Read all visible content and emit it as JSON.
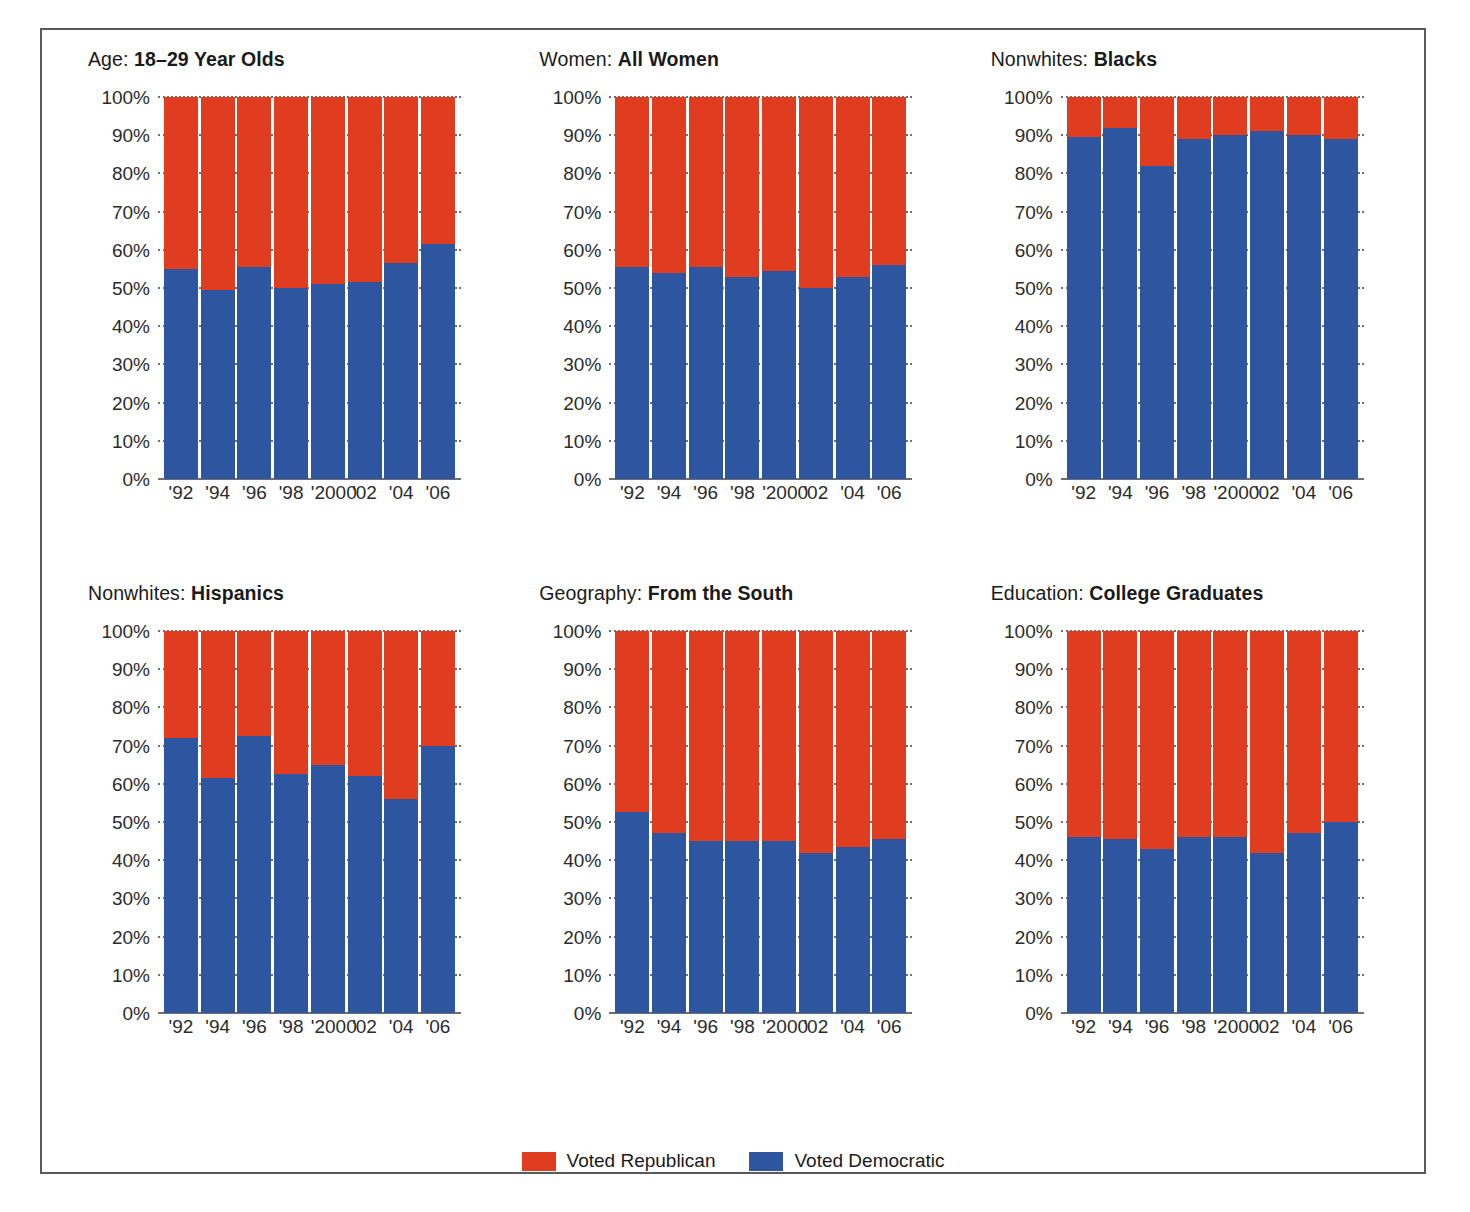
{
  "chart_data": {
    "type": "bar",
    "subtype": "stacked-100-percent",
    "title": "",
    "xlabel": "",
    "ylabel": "",
    "ylim": [
      0,
      100
    ],
    "ytick_labels": [
      "100%",
      "90%",
      "80%",
      "70%",
      "60%",
      "50%",
      "40%",
      "30%",
      "20%",
      "10%",
      "0%"
    ],
    "ytick_values": [
      100,
      90,
      80,
      70,
      60,
      50,
      40,
      30,
      20,
      10,
      0
    ],
    "grid": true,
    "legend_position": "bottom-center",
    "categories": [
      "'92",
      "'94",
      "'96",
      "'98",
      "'2000",
      "'02",
      "'04",
      "'06"
    ],
    "series": [
      {
        "name": "Voted Democratic",
        "color": "#2e56a0"
      },
      {
        "name": "Voted Republican",
        "color": "#e03c20"
      }
    ],
    "panels": [
      {
        "id": "age-18-29",
        "title_prefix": "Age:",
        "title_bold": "18–29 Year Olds",
        "democratic": [
          55,
          49.5,
          55.5,
          50,
          51,
          51.5,
          56.5,
          61.5
        ],
        "republican": [
          45,
          50.5,
          44.5,
          50,
          49,
          48.5,
          43.5,
          38.5
        ]
      },
      {
        "id": "women-all",
        "title_prefix": "Women:",
        "title_bold": "All Women",
        "democratic": [
          55.5,
          54,
          55.5,
          53,
          54.5,
          50,
          53,
          56
        ],
        "republican": [
          44.5,
          46,
          44.5,
          47,
          45.5,
          50,
          47,
          44
        ]
      },
      {
        "id": "nonwhites-blacks",
        "title_prefix": "Nonwhites:",
        "title_bold": "Blacks",
        "democratic": [
          89.5,
          92,
          82,
          89,
          90,
          91,
          90,
          89
        ],
        "republican": [
          10.5,
          8,
          18,
          11,
          10,
          9,
          10,
          11
        ]
      },
      {
        "id": "nonwhites-hispanics",
        "title_prefix": "Nonwhites:",
        "title_bold": "Hispanics",
        "democratic": [
          72,
          61.5,
          72.5,
          62.5,
          65,
          62,
          56,
          70
        ],
        "republican": [
          28,
          38.5,
          27.5,
          37.5,
          35,
          38,
          44,
          30
        ]
      },
      {
        "id": "geography-south",
        "title_prefix": "Geography:",
        "title_bold": "From the South",
        "democratic": [
          52.5,
          47,
          45,
          45,
          45,
          42,
          43.5,
          45.5
        ],
        "republican": [
          47.5,
          53,
          55,
          55,
          55,
          58,
          56.5,
          54.5
        ]
      },
      {
        "id": "education-college",
        "title_prefix": "Education:",
        "title_bold": "College Graduates",
        "democratic": [
          46,
          45.5,
          43,
          46,
          46,
          42,
          47,
          50
        ],
        "republican": [
          54,
          54.5,
          57,
          54,
          54,
          58,
          53,
          50
        ]
      }
    ]
  },
  "legend": {
    "items": [
      {
        "label": "Voted Republican",
        "color": "#e03c20"
      },
      {
        "label": "Voted Democratic",
        "color": "#2e56a0"
      }
    ]
  }
}
